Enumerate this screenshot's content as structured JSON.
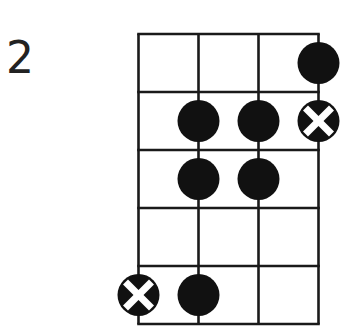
{
  "diagram": {
    "type": "chord-fretboard",
    "position_label": "2",
    "strings": 4,
    "frets": 5,
    "colors": {
      "grid": "#1a1a1a",
      "dot": "#111111",
      "cross": "#ffffff",
      "label": "#222222",
      "background": "#ffffff"
    },
    "markers": [
      {
        "string": 4,
        "fret": 1,
        "kind": "dot"
      },
      {
        "string": 2,
        "fret": 2,
        "kind": "dot"
      },
      {
        "string": 3,
        "fret": 2,
        "kind": "dot"
      },
      {
        "string": 4,
        "fret": 2,
        "kind": "x-dot"
      },
      {
        "string": 2,
        "fret": 3,
        "kind": "dot"
      },
      {
        "string": 3,
        "fret": 3,
        "kind": "dot"
      },
      {
        "string": 1,
        "fret": 5,
        "kind": "x-dot"
      },
      {
        "string": 2,
        "fret": 5,
        "kind": "dot"
      }
    ]
  }
}
